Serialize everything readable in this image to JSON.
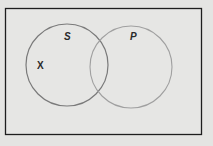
{
  "diagram": {
    "type": "venn",
    "universe": {
      "x": 5,
      "y": 8,
      "width": 196,
      "height": 126,
      "stroke": "#1e1e1e"
    },
    "sets": [
      {
        "name": "S",
        "label": "S",
        "cx": 67,
        "cy": 65,
        "r": 41,
        "label_x": 67,
        "label_y": 40,
        "stroke": "#7a7a7a"
      },
      {
        "name": "P",
        "label": "P",
        "cx": 131,
        "cy": 67,
        "r": 41,
        "label_x": 133,
        "label_y": 40,
        "stroke": "#9a9a9a"
      }
    ],
    "marks": [
      {
        "label": "X",
        "x": 41,
        "y": 69,
        "region": "S only"
      }
    ],
    "background": "#e4e4e2"
  }
}
